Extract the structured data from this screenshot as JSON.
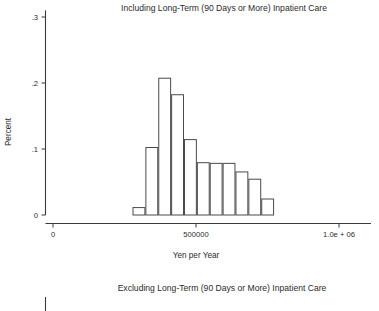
{
  "panels": [
    {
      "title": "Including Long-Term (90 Days or More) Inpatient Care",
      "ylabel": "Percent",
      "xlabel": "Yen per Year"
    },
    {
      "title": "Excluding Long-Term (90 Days or More) Inpatient Care"
    }
  ],
  "yticks": [
    "0",
    ".1",
    ".2",
    ".3"
  ],
  "xticks": [
    "0",
    "500000",
    "1.0e + 06"
  ],
  "colors": {
    "axis": "#3a3a3a",
    "bar_stroke": "#4a4a4a",
    "bar_fill": "#ffffff",
    "text": "#2b2b2b",
    "background": "#ffffff"
  },
  "chart_data": {
    "type": "bar",
    "title": "Including Long-Term (90 Days or More) Inpatient Care",
    "xlabel": "Yen per Year",
    "ylabel": "Percent",
    "xlim": [
      0,
      1075000
    ],
    "ylim": [
      0,
      0.31
    ],
    "yticks": [
      0,
      0.1,
      0.2,
      0.3
    ],
    "ytick_labels": [
      "0",
      ".1",
      ".2",
      ".3"
    ],
    "xticks": [
      0,
      500000,
      1000000
    ],
    "xtick_labels": [
      "0",
      "500000",
      "1.0e + 06"
    ],
    "grid": false,
    "legend": false,
    "bin_width": 45000,
    "bin_left_edges": [
      278000,
      323000,
      368000,
      413000,
      458000,
      503000,
      548000,
      593000,
      638000,
      683000,
      728000
    ],
    "bin_centers": [
      300500,
      345500,
      390500,
      435500,
      480500,
      525500,
      570500,
      615500,
      660500,
      705500,
      750500
    ],
    "categories": [
      "278k-323k",
      "323k-368k",
      "368k-413k",
      "413k-458k",
      "458k-503k",
      "503k-548k",
      "548k-593k",
      "593k-638k",
      "638k-683k",
      "683k-728k",
      "728k-773k"
    ],
    "values": [
      0.012,
      0.103,
      0.208,
      0.183,
      0.115,
      0.08,
      0.079,
      0.079,
      0.066,
      0.055,
      0.025
    ]
  }
}
